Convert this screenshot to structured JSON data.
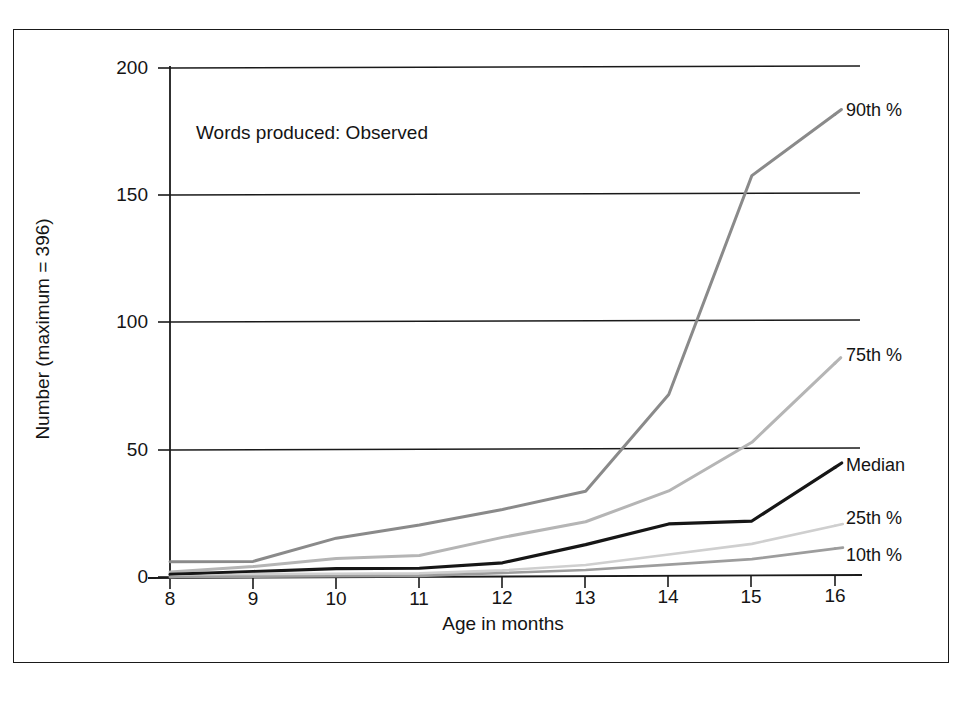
{
  "figure": {
    "title": "Words produced: Observed",
    "x_axis_title": "Age in months",
    "y_axis_title": "Number (maximum = 396)"
  },
  "chart_data": {
    "type": "line",
    "title": "Words produced: Observed",
    "xlabel": "Age in months",
    "ylabel": "Number (maximum = 396)",
    "x": [
      8,
      9,
      10,
      11,
      12,
      13,
      14,
      15,
      16
    ],
    "xlim": [
      8,
      16
    ],
    "ylim": [
      0,
      200
    ],
    "xticks": [
      "8",
      "9",
      "10",
      "11",
      "12",
      "13",
      "14",
      "15",
      "16"
    ],
    "yticks": [
      "0",
      "50",
      "100",
      "150",
      "200"
    ],
    "grid": "horizontal",
    "legend_position": "right-inline-end-of-line",
    "series": [
      {
        "name": "90th %",
        "color": "#8a8a8a",
        "width": 3.0,
        "values": [
          6,
          6,
          15,
          20,
          26,
          33,
          71,
          157,
          181
        ]
      },
      {
        "name": "75th %",
        "color": "#b5b5b5",
        "width": 3.0,
        "values": [
          2,
          4,
          7,
          8,
          15,
          21,
          33,
          52,
          83
        ]
      },
      {
        "name": "Median",
        "color": "#161616",
        "width": 3.2,
        "values": [
          1,
          2,
          3,
          3,
          5,
          12,
          20,
          21,
          42
        ]
      },
      {
        "name": "25th %",
        "color": "#cfcfcf",
        "width": 2.6,
        "values": [
          0,
          1,
          1,
          1,
          2,
          4,
          8,
          12,
          19
        ]
      },
      {
        "name": "10th %",
        "color": "#9d9d9d",
        "width": 2.6,
        "values": [
          0,
          0,
          0,
          0,
          1,
          2,
          4,
          6,
          10
        ]
      }
    ]
  },
  "legend_labels": {
    "p90": "90th %",
    "p75": "75th %",
    "median": "Median",
    "p25": "25th %",
    "p10": "10th %"
  },
  "ticks": {
    "y": [
      "200",
      "150",
      "100",
      "50",
      "0"
    ],
    "x": [
      "8",
      "9",
      "10",
      "11",
      "12",
      "13",
      "14",
      "15",
      "16"
    ]
  },
  "colors": {
    "axis": "#1a1a1a",
    "text": "#141414",
    "p90": "#8a8a8a",
    "p75": "#b5b5b5",
    "median": "#161616",
    "p25": "#cfcfcf",
    "p10": "#9d9d9d"
  }
}
